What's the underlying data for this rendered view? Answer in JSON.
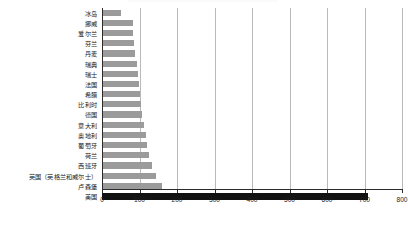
{
  "chart_data": {
    "type": "bar",
    "orientation": "horizontal",
    "title": "",
    "xlabel": "",
    "ylabel": "",
    "xlim": [
      0,
      800
    ],
    "xticks": [
      0,
      100,
      200,
      300,
      400,
      500,
      600,
      700,
      800
    ],
    "grid": true,
    "legend": false,
    "categories": [
      "冰岛",
      "挪威",
      "爱尔兰",
      "芬兰",
      "丹麦",
      "瑞典",
      "瑞士",
      "法国",
      "希腊",
      "比利时",
      "德国",
      "意大利",
      "奥地利",
      "葡萄牙",
      "荷兰",
      "西班牙",
      "英国（英格兰和威尔士）",
      "卢森堡",
      "美国"
    ],
    "values": [
      50,
      82,
      82,
      84,
      88,
      92,
      95,
      98,
      100,
      104,
      107,
      112,
      118,
      120,
      126,
      132,
      143,
      160,
      710
    ],
    "colors": {
      "bar": "#9b9b9b",
      "highlight": "#121212",
      "grid": "#b9b9b9",
      "axis": "#2b2b2b"
    },
    "highlight_index": 18
  }
}
